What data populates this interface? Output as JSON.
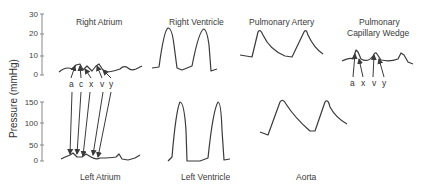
{
  "y_axis": {
    "label": "Pressure (mmHg)",
    "upper_ticks": [
      "30",
      "20",
      "10",
      "0"
    ],
    "lower_ticks": [
      "150",
      "100",
      "50",
      "0"
    ]
  },
  "panels": {
    "right_atrium": {
      "title": "Right Atrium",
      "wave_letters": [
        "a",
        "c",
        "x",
        "v",
        "y"
      ]
    },
    "right_ventricle": {
      "title": "Right Ventricle"
    },
    "pulmonary_artery": {
      "title": "Pulmonary Artery"
    },
    "pcw": {
      "title_line1": "Pulmonary",
      "title_line2": "Capillary Wedge",
      "wave_letters": [
        "a",
        "x",
        "v",
        "y"
      ]
    },
    "left_atrium": {
      "title": "Left Atrium"
    },
    "left_ventricle": {
      "title": "Left Ventricle"
    },
    "aorta": {
      "title": "Aorta"
    }
  },
  "colors": {
    "trace": "#3a3a3a",
    "axis": "#888888"
  }
}
